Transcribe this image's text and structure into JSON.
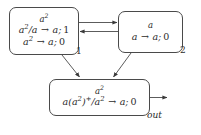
{
  "diagram": {
    "type": "membrane-system-graph",
    "title": "",
    "stroke_color": "#4a4a4a",
    "text_color": "#2b2b2b",
    "background_color": "#ffffff",
    "cells": [
      {
        "id": "cell-1",
        "label": "1",
        "alphabet": "a^2",
        "alphabet_base": "a",
        "alphabet_exponent": "2",
        "rules": [
          {
            "text": "a^2/a -> a; 1",
            "left_numerator_base": "a",
            "left_numerator_exponent": "2",
            "left_denominator": "a",
            "arrow": "→",
            "right": "a",
            "weight": "1"
          },
          {
            "text": "a^2 -> a; 0",
            "left_base": "a",
            "left_exponent": "2",
            "arrow": "→",
            "right": "a",
            "weight": "0"
          }
        ]
      },
      {
        "id": "cell-2",
        "label": "2",
        "alphabet": "a",
        "rules": [
          {
            "text": "a -> a; 0",
            "left": "a",
            "arrow": "→",
            "right": "a",
            "weight": "0"
          }
        ]
      },
      {
        "id": "cell-out",
        "label": "out",
        "alphabet": "a^2",
        "alphabet_base": "a",
        "alphabet_exponent": "2",
        "rules": [
          {
            "text": "a(a^2)^+/a^2 -> a; 0",
            "left_prefix": "a",
            "left_group_base": "a",
            "left_group_exponent": "2",
            "left_group_plus": "+",
            "left_denominator_base": "a",
            "left_denominator_exponent": "2",
            "arrow": "→",
            "right": "a",
            "weight": "0"
          }
        ]
      }
    ],
    "edges": [
      {
        "id": "edge-1-to-2",
        "from": "cell-1",
        "to": "cell-2",
        "direction": "right",
        "style": "straight"
      },
      {
        "id": "edge-2-to-1",
        "from": "cell-2",
        "to": "cell-1",
        "direction": "left",
        "style": "straight"
      },
      {
        "id": "edge-1-to-out",
        "from": "cell-1",
        "to": "cell-out",
        "direction": "down-right",
        "style": "diagonal"
      },
      {
        "id": "edge-2-to-out",
        "from": "cell-2",
        "to": "cell-out",
        "direction": "down-left",
        "style": "diagonal"
      },
      {
        "id": "edge-out-to-environment",
        "from": "cell-out",
        "to": "environment",
        "direction": "right",
        "style": "straight"
      }
    ]
  }
}
